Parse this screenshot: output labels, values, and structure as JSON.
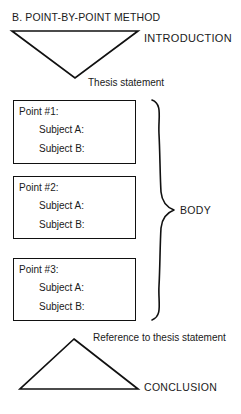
{
  "title": "B. POINT-BY-POINT METHOD",
  "diagram": {
    "introduction": {
      "shape_name": "inverted-triangle",
      "label": "INTRODUCTION",
      "annotation": "Thesis statement"
    },
    "body": {
      "label": "BODY",
      "brace": "right-curly-brace",
      "points": [
        {
          "title": "Point  #1:",
          "subject_a": "Subject  A:",
          "subject_b": "Subject  B:"
        },
        {
          "title": "Point  #2:",
          "subject_a": "Subject  A:",
          "subject_b": "Subject  B:"
        },
        {
          "title": "Point  #3:",
          "subject_a": "Subject  A:",
          "subject_b": "Subject  B:"
        }
      ]
    },
    "conclusion": {
      "shape_name": "upright-triangle",
      "label": "CONCLUSION",
      "annotation": "Reference to thesis statement"
    }
  },
  "colors": {
    "ink": "#1a1a1a",
    "stroke": "#111111",
    "background": "#ffffff"
  }
}
